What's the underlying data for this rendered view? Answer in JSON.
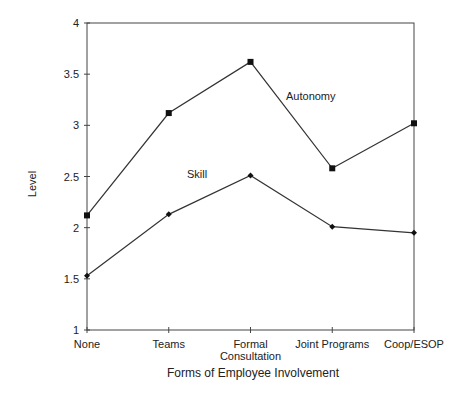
{
  "chart_data": {
    "type": "line",
    "title": "",
    "xlabel": "Forms of Employee Involvement",
    "ylabel": "Level",
    "categories": [
      "None",
      "Teams",
      "Formal Consultation",
      "Joint Programs",
      "Coop/ESOP"
    ],
    "category_lines": [
      [
        "None"
      ],
      [
        "Teams"
      ],
      [
        "Formal",
        "Consultation"
      ],
      [
        "Joint Programs"
      ],
      [
        "Coop/ESOP"
      ]
    ],
    "yticks": [
      1,
      1.5,
      2,
      2.5,
      3,
      3.5,
      4
    ],
    "ytick_labels": [
      "1",
      "1.5",
      "2",
      "2.5",
      "3",
      "3.5",
      "4"
    ],
    "ylim": [
      1,
      4
    ],
    "grid": false,
    "series": [
      {
        "name": "Autonomy",
        "marker": "square",
        "values": [
          2.12,
          3.12,
          3.62,
          2.58,
          3.02
        ]
      },
      {
        "name": "Skill",
        "marker": "diamond",
        "values": [
          1.53,
          2.13,
          2.51,
          2.01,
          1.95
        ]
      }
    ],
    "annotations": [
      {
        "text": "Autonomy",
        "x": 286,
        "y": 100
      },
      {
        "text": "Skill",
        "x": 187,
        "y": 178
      }
    ]
  }
}
